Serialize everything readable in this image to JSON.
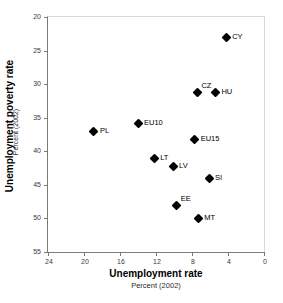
{
  "chart_data": {
    "type": "scatter",
    "title": "",
    "xlabel": "Unemployment rate",
    "xsublabel": "Percent (2002)",
    "ylabel": "Unemployment poverty rate",
    "ysublabel": "Percent (2002)",
    "xlim": [
      24,
      0
    ],
    "ylim": [
      20,
      55
    ],
    "x_inverted": true,
    "y_inverted": true,
    "xticks": [
      24,
      20,
      16,
      12,
      8,
      4,
      0
    ],
    "yticks": [
      20,
      25,
      30,
      35,
      40,
      45,
      50,
      55
    ],
    "grid": false,
    "legend": "none",
    "marker": "filled-diamond",
    "marker_color": "#000000",
    "points": [
      {
        "label": "CY",
        "x": 4.2,
        "y": 23.0,
        "label_pos": "right"
      },
      {
        "label": "CZ",
        "x": 7.4,
        "y": 31.2,
        "label_pos": "upright"
      },
      {
        "label": "HU",
        "x": 5.4,
        "y": 31.2,
        "label_pos": "right"
      },
      {
        "label": "EU10",
        "x": 14.0,
        "y": 35.8,
        "label_pos": "right"
      },
      {
        "label": "PL",
        "x": 18.9,
        "y": 37.0,
        "label_pos": "right"
      },
      {
        "label": "EU15",
        "x": 7.7,
        "y": 38.2,
        "label_pos": "right"
      },
      {
        "label": "LT",
        "x": 12.2,
        "y": 41.0,
        "label_pos": "right"
      },
      {
        "label": "LV",
        "x": 10.1,
        "y": 42.2,
        "label_pos": "right"
      },
      {
        "label": "SI",
        "x": 6.1,
        "y": 44.0,
        "label_pos": "right"
      },
      {
        "label": "EE",
        "x": 9.7,
        "y": 48.0,
        "label_pos": "upright"
      },
      {
        "label": "MT",
        "x": 7.3,
        "y": 50.0,
        "label_pos": "right"
      }
    ]
  }
}
